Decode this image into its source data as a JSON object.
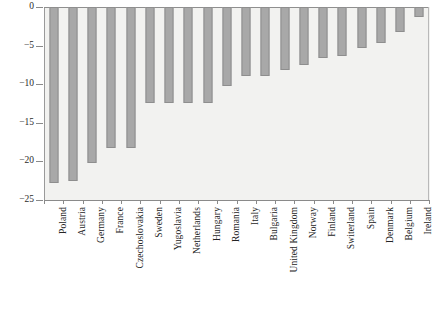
{
  "chart_data": {
    "type": "bar",
    "title": "",
    "subtitle": "",
    "xlabel": "",
    "ylabel": "",
    "orientation": "vertical",
    "grid": false,
    "legend": null,
    "ylim": [
      -25,
      0
    ],
    "yticks": [
      0,
      -5,
      -10,
      -15,
      -20,
      -25
    ],
    "ytick_labels": [
      "0",
      "−5",
      "−10",
      "−15",
      "−20",
      "−25"
    ],
    "bar_color": "#a8a8a8",
    "bar_edge_color": "#8e8e8e",
    "plot_background": "#f2f2f0",
    "categories": [
      "Poland",
      "Austria",
      "Germany",
      "France",
      "Czechoslovakia",
      "Sweden",
      "Yugoslavia",
      "Netherlands",
      "Hungary",
      "Romania",
      "Italy",
      "Bulgaria",
      "United Kingdom",
      "Norway",
      "Finland",
      "Switerland",
      "Spain",
      "Denmark",
      "Belgium",
      "Ireland"
    ],
    "values": [
      -22.8,
      -22.6,
      -20.2,
      -18.2,
      -18.2,
      -12.4,
      -12.4,
      -12.4,
      -12.4,
      -10.2,
      -9.0,
      -9.0,
      -8.2,
      -7.5,
      -6.6,
      -6.3,
      -5.3,
      -4.6,
      -3.3,
      -1.3
    ]
  }
}
